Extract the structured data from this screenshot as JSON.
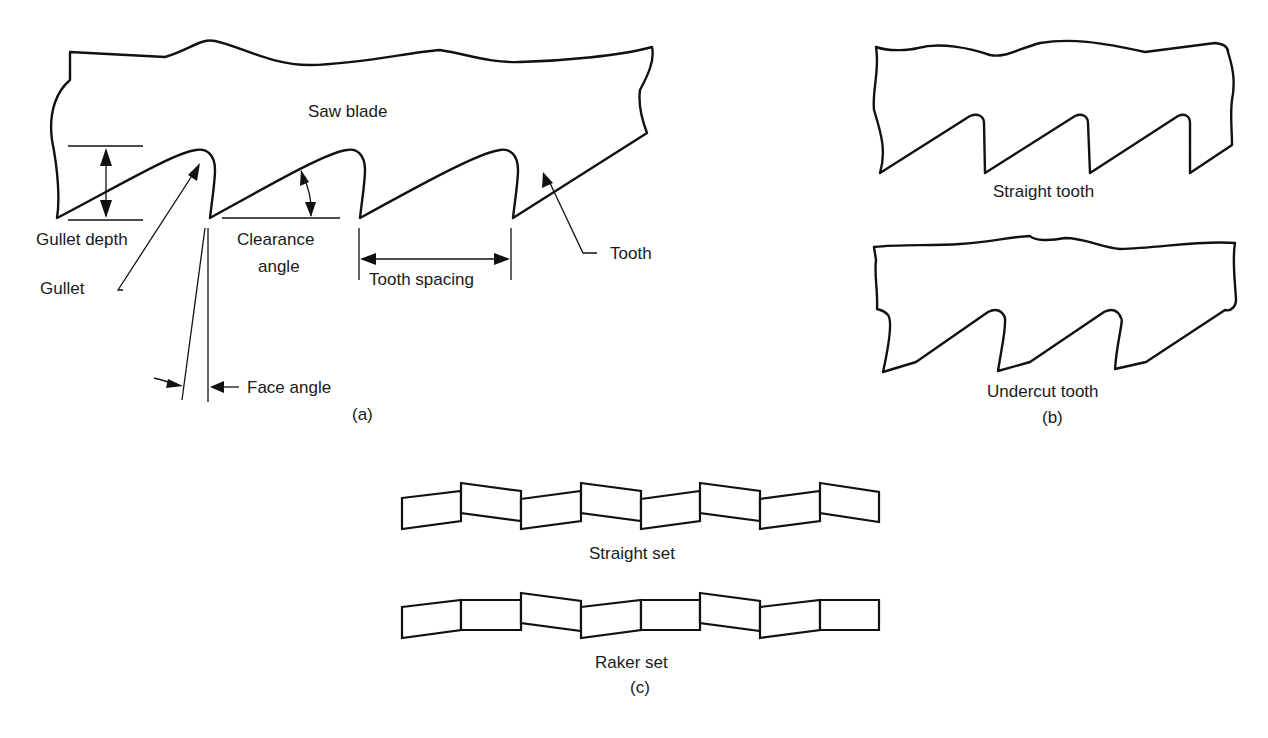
{
  "figure": {
    "panel_a": {
      "caption": "(a)",
      "labels": {
        "saw_blade": "Saw blade",
        "gullet_depth": "Gullet depth",
        "clearance_angle_line1": "Clearance",
        "clearance_angle_line2": "angle",
        "tooth_spacing": "Tooth spacing",
        "tooth": "Tooth",
        "gullet": "Gullet",
        "face_angle": "Face angle"
      }
    },
    "panel_b": {
      "caption": "(b)",
      "labels": {
        "straight_tooth": "Straight tooth",
        "undercut_tooth": "Undercut tooth"
      }
    },
    "panel_c": {
      "caption": "(c)",
      "labels": {
        "straight_set": "Straight set",
        "raker_set": "Raker set"
      }
    }
  }
}
